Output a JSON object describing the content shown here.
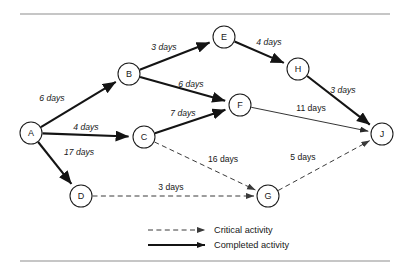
{
  "figure": {
    "type": "project-network-diagram",
    "title": "",
    "background": "#ffffff",
    "border_rules": {
      "color": "#8d8d8d",
      "top_y": 14,
      "bottom_y": 261,
      "x_start": 20,
      "x_end": 390
    }
  },
  "nodes": [
    {
      "id": "A",
      "label": "A",
      "x": 31,
      "y": 133,
      "r": 11
    },
    {
      "id": "B",
      "label": "B",
      "x": 129,
      "y": 74,
      "r": 11
    },
    {
      "id": "C",
      "label": "C",
      "x": 144,
      "y": 137,
      "r": 11
    },
    {
      "id": "D",
      "label": "D",
      "x": 81,
      "y": 196,
      "r": 11
    },
    {
      "id": "E",
      "label": "E",
      "x": 224,
      "y": 37,
      "r": 11
    },
    {
      "id": "F",
      "label": "F",
      "x": 240,
      "y": 105,
      "r": 11
    },
    {
      "id": "G",
      "label": "G",
      "x": 268,
      "y": 196,
      "r": 11
    },
    {
      "id": "H",
      "label": "H",
      "x": 298,
      "y": 69,
      "r": 11
    },
    {
      "id": "J",
      "label": "J",
      "x": 382,
      "y": 134,
      "r": 11
    }
  ],
  "edges": [
    {
      "from": "A",
      "to": "B",
      "label": "6 days",
      "days": 6,
      "style": "completed",
      "italic": true,
      "label_x": 52,
      "label_y": 98
    },
    {
      "from": "A",
      "to": "C",
      "label": "4 days",
      "days": 4,
      "style": "completed",
      "italic": true,
      "label_x": 86,
      "label_y": 127
    },
    {
      "from": "A",
      "to": "D",
      "label": "17 days",
      "days": 17,
      "style": "completed",
      "italic": true,
      "label_x": 79,
      "label_y": 152
    },
    {
      "from": "B",
      "to": "E",
      "label": "3 days",
      "days": 3,
      "style": "completed",
      "italic": true,
      "label_x": 164,
      "label_y": 47
    },
    {
      "from": "B",
      "to": "F",
      "label": "6 days",
      "days": 6,
      "style": "completed",
      "italic": true,
      "label_x": 191,
      "label_y": 84
    },
    {
      "from": "C",
      "to": "F",
      "label": "7 days",
      "days": 7,
      "style": "completed",
      "italic": true,
      "label_x": 183,
      "label_y": 113
    },
    {
      "from": "C",
      "to": "G",
      "label": "16 days",
      "days": 16,
      "style": "critical",
      "italic": false,
      "label_x": 223,
      "label_y": 159
    },
    {
      "from": "D",
      "to": "G",
      "label": "3 days",
      "days": 3,
      "style": "critical",
      "italic": false,
      "label_x": 171,
      "label_y": 187
    },
    {
      "from": "E",
      "to": "H",
      "label": "4 days",
      "days": 4,
      "style": "completed",
      "italic": true,
      "label_x": 269,
      "label_y": 42
    },
    {
      "from": "F",
      "to": "J",
      "label": "11 days",
      "days": 11,
      "style": "thin",
      "italic": false,
      "label_x": 311,
      "label_y": 108
    },
    {
      "from": "G",
      "to": "J",
      "label": "5 days",
      "days": 5,
      "style": "critical",
      "italic": false,
      "label_x": 303,
      "label_y": 157
    },
    {
      "from": "H",
      "to": "J",
      "label": "3 days",
      "days": 3,
      "style": "completed",
      "italic": true,
      "label_x": 343,
      "label_y": 90
    }
  ],
  "legend": {
    "items": [
      {
        "key": "critical",
        "label": "Critical activity",
        "style": "dashed",
        "y": 230
      },
      {
        "key": "completed",
        "label": "Completed activity",
        "style": "solid",
        "y": 245
      }
    ],
    "line_x_start": 148,
    "line_x_end": 205,
    "text_x": 214
  },
  "colors": {
    "stroke_dark": "#141414",
    "stroke_mid": "#3a3a3a",
    "rule": "#8d8d8d",
    "text": "#171717",
    "node_fill": "#ffffff"
  }
}
